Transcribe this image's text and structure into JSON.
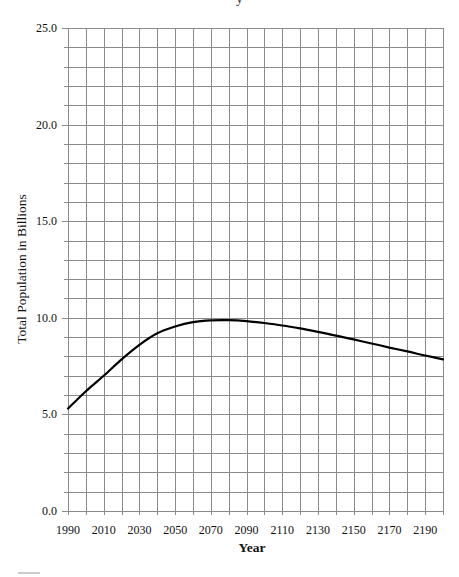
{
  "chart_data": {
    "type": "line",
    "title": "",
    "xlabel": "Year",
    "ylabel": "Total Population in Billions",
    "xlim": [
      1990,
      2200
    ],
    "ylim": [
      0,
      25
    ],
    "x_ticks": [
      1990,
      2010,
      2030,
      2050,
      2070,
      2090,
      2110,
      2130,
      2150,
      2170,
      2190
    ],
    "y_ticks": [
      "0.0",
      "5.0",
      "10.0",
      "15.0",
      "20.0",
      "25.0"
    ],
    "grid": {
      "on": true,
      "x_step": 10,
      "y_step": 1
    },
    "legend": null,
    "series": [
      {
        "name": "Total Population",
        "color": "#000000",
        "x": [
          1990,
          2000,
          2010,
          2020,
          2030,
          2040,
          2050,
          2060,
          2070,
          2080,
          2090,
          2100,
          2110,
          2120,
          2130,
          2140,
          2150,
          2160,
          2170,
          2180,
          2190,
          2200
        ],
        "values": [
          5.3,
          6.2,
          7.0,
          7.85,
          8.6,
          9.2,
          9.55,
          9.78,
          9.87,
          9.88,
          9.83,
          9.73,
          9.6,
          9.45,
          9.27,
          9.08,
          8.88,
          8.67,
          8.46,
          8.26,
          8.05,
          7.85
        ]
      }
    ]
  },
  "labels": {
    "xlabel": "Year",
    "ylabel": "Total Population in Billions",
    "title_fragment": "y"
  },
  "colors": {
    "grid": "#8a8a8a",
    "line": "#000000",
    "text": "#111111"
  }
}
